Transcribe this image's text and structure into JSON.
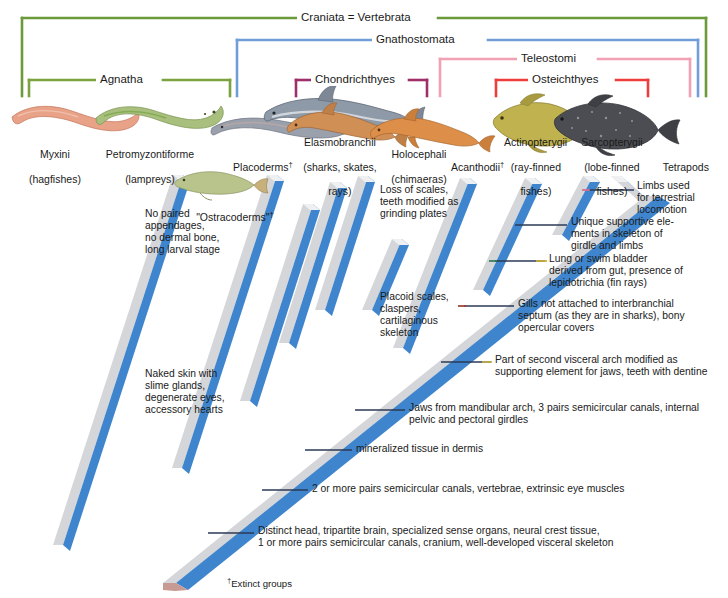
{
  "clades": [
    {
      "id": "craniata",
      "label": "Craniata = Vertebrata",
      "color": "#6a9a3a"
    },
    {
      "id": "gnathostomata",
      "label": "Gnathostomata",
      "color": "#6f9ed8"
    },
    {
      "id": "teleostomi",
      "label": "Teleostomi",
      "color": "#f2a0b4"
    },
    {
      "id": "agnatha",
      "label": "Agnatha",
      "color": "#7ba23f"
    },
    {
      "id": "chondrichthyes",
      "label": "Chondrichthyes",
      "color": "#9e2f6a"
    },
    {
      "id": "osteichthyes",
      "label": "Osteichthyes",
      "color": "#ef3d3d"
    }
  ],
  "taxa": [
    {
      "id": "myxini",
      "line1": "Myxini",
      "line2": "(hagfishes)",
      "extinct": false
    },
    {
      "id": "petromyzontiforme",
      "line1": "Petromyzontiforme",
      "line2": "(lampreys)",
      "extinct": false
    },
    {
      "id": "ostracoderms",
      "line1": "\"Ostracoderms\"",
      "line2": "",
      "extinct": true
    },
    {
      "id": "placoderms",
      "line1": "Placoderms",
      "line2": "",
      "extinct": true
    },
    {
      "id": "elasmobranchii",
      "line1": "Elasmobranchii",
      "line2": "(sharks, skates,",
      "line3": "rays)",
      "extinct": false
    },
    {
      "id": "holocephali",
      "line1": "Holocephali",
      "line2": "(chimaeras)",
      "extinct": false
    },
    {
      "id": "acanthodii",
      "line1": "Acanthodii",
      "line2": "",
      "extinct": true
    },
    {
      "id": "actinopterygii",
      "line1": "Actinopterygii",
      "line2": "(ray-finned",
      "line3": "fishes)",
      "extinct": false
    },
    {
      "id": "sarcopterygii",
      "line1": "Sarcopterygii",
      "line2": "(lobe-finned",
      "line3": "fishes)",
      "extinct": false
    },
    {
      "id": "tetrapods",
      "line1": "Tetrapods",
      "line2": "",
      "extinct": false
    }
  ],
  "annotations": [
    {
      "id": "limbs",
      "text": "Limbs used\nfor terrestrial\nlocomotion"
    },
    {
      "id": "girdle",
      "text": "Unique supportive ele-\nments in skeleton of\ngirdle and limbs"
    },
    {
      "id": "lung",
      "text": "Lung or swim bladder\nderived from gut, presence of\nlepidotrichia (fin rays)"
    },
    {
      "id": "gills",
      "text": "Gills not attached to interbranchial\nseptum (as they are in sharks), bony\nopercular covers"
    },
    {
      "id": "visceral-arch",
      "text": "Part of second visceral arch modified as\nsupporting element for jaws, teeth with dentine"
    },
    {
      "id": "jaws",
      "text": "Jaws from mandibular arch, 3 pairs semicircular canals, internal\npelvic and pectoral girdles"
    },
    {
      "id": "mineralized",
      "text": "mineralized tissue in dermis"
    },
    {
      "id": "semicircular",
      "text": "2 or more pairs semicircular canals, vertebrae, extrinsic eye muscles"
    },
    {
      "id": "distinct-head",
      "text": "Distinct head, tripartite brain, specialized sense organs, neural crest tissue,\n1 or more pairs semicircular canals, cranium, well-developed visceral skeleton"
    },
    {
      "id": "no-paired",
      "text": "No paired\nappendages,\nno dermal bone,\nlong larval stage"
    },
    {
      "id": "naked-skin",
      "text": "Naked skin with\nslime glands,\ndegenerate eyes,\naccessory hearts"
    },
    {
      "id": "loss-scales",
      "text": "Loss of scales,\nteeth modified as\ngrinding plates"
    },
    {
      "id": "placoid",
      "text": "Placoid scales,\nclaspers,\ncartilaginous\nskeleton"
    }
  ],
  "footnote": {
    "marker": "†",
    "text": "Extinct groups"
  },
  "colors": {
    "branch_face": "#3f85cd",
    "branch_top": "#d4d6d9",
    "branch_top_shade": "#c0c3c7",
    "branch_end": "#c79a93",
    "text": "#231f20",
    "leader": "#2b3a55"
  }
}
